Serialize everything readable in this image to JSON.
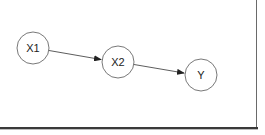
{
  "diagram": {
    "type": "directed-graph",
    "nodes": [
      {
        "id": "X1",
        "label": "X1",
        "cx": 33,
        "cy": 48,
        "r": 16
      },
      {
        "id": "X2",
        "label": "X2",
        "cx": 118,
        "cy": 62,
        "r": 16
      },
      {
        "id": "Y",
        "label": "Y",
        "cx": 201,
        "cy": 75,
        "r": 16
      }
    ],
    "edges": [
      {
        "from": "X1",
        "to": "X2"
      },
      {
        "from": "X2",
        "to": "Y"
      }
    ],
    "colors": {
      "node_stroke": "#555555",
      "edge": "#333333",
      "text": "#222222",
      "background": "#ffffff"
    }
  }
}
